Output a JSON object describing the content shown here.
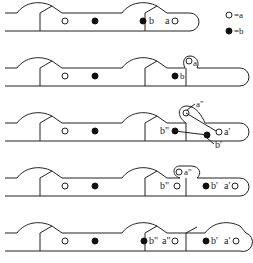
{
  "legend": {
    "open_label": "=a",
    "filled_label": "=b"
  },
  "stages": [
    {
      "labels": {
        "b": "b",
        "a": "a"
      }
    },
    {
      "labels": {
        "a": "a",
        "b": "b"
      }
    },
    {
      "labels": {
        "a2": "a\"",
        "b2": "b\"",
        "a1": "a'",
        "b1": "b'"
      }
    },
    {
      "labels": {
        "a2": "a\"",
        "b2": "b\"",
        "b1": "b'",
        "a1": "a'"
      }
    },
    {
      "labels": {
        "b2": "b\"",
        "a2": "a\"",
        "b1": "b'",
        "a1": "a'"
      }
    }
  ]
}
